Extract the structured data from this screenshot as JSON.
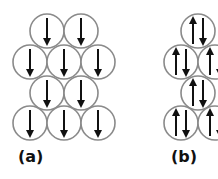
{
  "panels": [
    {
      "id": "a",
      "label": "(a)",
      "label_pos": [
        18,
        147
      ],
      "description": "All spins aligned (ferromagnetic, all down)",
      "circles": [
        {
          "cx": 47,
          "cy": 31,
          "spin": "down"
        },
        {
          "cx": 81,
          "cy": 31,
          "spin": "down"
        },
        {
          "cx": 30,
          "cy": 62,
          "spin": "down"
        },
        {
          "cx": 64,
          "cy": 62,
          "spin": "down"
        },
        {
          "cx": 98,
          "cy": 62,
          "spin": "down"
        },
        {
          "cx": 47,
          "cy": 93,
          "spin": "down"
        },
        {
          "cx": 81,
          "cy": 93,
          "spin": "down"
        },
        {
          "cx": 30,
          "cy": 123,
          "spin": "down"
        },
        {
          "cx": 64,
          "cy": 123,
          "spin": "down"
        },
        {
          "cx": 98,
          "cy": 123,
          "spin": "down"
        }
      ]
    },
    {
      "id": "b",
      "label": "(b)",
      "label_pos": [
        171,
        147
      ],
      "description": "Paired up/down spins in each site",
      "circles": [
        {
          "cx": 198,
          "cy": 31,
          "spin": "pair"
        },
        {
          "cx": 181,
          "cy": 62,
          "spin": "pair"
        },
        {
          "cx": 215,
          "cy": 62,
          "spin": "pair"
        },
        {
          "cx": 198,
          "cy": 93,
          "spin": "pair"
        },
        {
          "cx": 181,
          "cy": 123,
          "spin": "pair"
        },
        {
          "cx": 215,
          "cy": 123,
          "spin": "pair"
        }
      ]
    }
  ],
  "style": {
    "circle_radius": 17,
    "circle_stroke": "#8a8a8a",
    "arrow_color": "#111111"
  }
}
